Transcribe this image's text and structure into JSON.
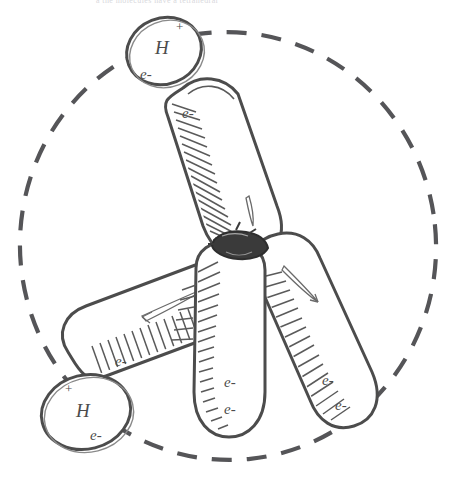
{
  "page": {
    "header_faint_text": "a                                          the molecules have a tetrahedral",
    "background_color": "#ffffff",
    "ink_color": "#4c4c4c",
    "shade_color": "#5a5a5a"
  },
  "figure": {
    "type": "hand-drawn-orbital-diagram",
    "enclosing_circle": {
      "name": "dashed-boundary-circle",
      "style": "dashed",
      "center_x": 228,
      "center_y": 246,
      "radius_x": 208,
      "radius_y": 215
    },
    "nucleus": {
      "name": "central-nucleus",
      "x": 238,
      "y": 247,
      "label": ""
    },
    "lobes": [
      {
        "id": "lobe-upper-left",
        "direction": "up-left",
        "kind": "bonding",
        "electron_labels": [
          "e-"
        ],
        "has_highlight_sliver": true,
        "shading_side": "left"
      },
      {
        "id": "lobe-lower-left",
        "direction": "down-left",
        "kind": "bonding",
        "electron_labels": [
          "e-"
        ],
        "has_highlight_sliver": true,
        "shading_side": "right"
      },
      {
        "id": "lobe-center-down",
        "direction": "down",
        "kind": "lone-pair",
        "electron_labels": [
          "e-",
          "e-"
        ],
        "has_highlight_sliver": false,
        "shading_side": "left"
      },
      {
        "id": "lobe-lower-right",
        "direction": "down-right",
        "kind": "lone-pair",
        "electron_labels": [
          "e-",
          "e-"
        ],
        "has_highlight_sliver": true,
        "shading_side": "left"
      }
    ],
    "hydrogens": [
      {
        "id": "hydrogen-top",
        "element": "H",
        "charge": "+",
        "electron_label": "e-",
        "attached_to": "lobe-upper-left",
        "cx": 164,
        "cy": 51
      },
      {
        "id": "hydrogen-bottom-left",
        "element": "H",
        "charge": "+",
        "electron_label": "e-",
        "attached_to": "lobe-lower-left",
        "cx": 86,
        "cy": 412
      }
    ],
    "electron_annotations": [
      {
        "id": "e-top-in-ellipse",
        "text": "e-",
        "x": 152,
        "y": 75
      },
      {
        "id": "e-upper-lobe",
        "text": "e-",
        "x": 190,
        "y": 115
      },
      {
        "id": "e-lower-left-lobe",
        "text": "e-",
        "x": 122,
        "y": 362
      },
      {
        "id": "e-bottom-left-ellipse",
        "text": "e-",
        "x": 98,
        "y": 432
      },
      {
        "id": "e-center-lobe-1",
        "text": "e-",
        "x": 232,
        "y": 382
      },
      {
        "id": "e-center-lobe-2",
        "text": "e-",
        "x": 232,
        "y": 410
      },
      {
        "id": "e-right-lobe-1",
        "text": "e-",
        "x": 330,
        "y": 381
      },
      {
        "id": "e-right-lobe-2",
        "text": "e-",
        "x": 343,
        "y": 406
      }
    ]
  }
}
